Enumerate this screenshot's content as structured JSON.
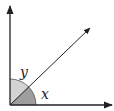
{
  "diagram": {
    "type": "angle-diagram",
    "labels": {
      "x": "x",
      "y": "y"
    },
    "colors": {
      "line": "#222222",
      "sector_y": "#d4d4d4",
      "sector_x": "#9e9e9e",
      "background": "#ffffff"
    },
    "elements": [
      {
        "kind": "axis",
        "direction": "vertical",
        "arrow": true
      },
      {
        "kind": "axis",
        "direction": "horizontal",
        "arrow": true
      },
      {
        "kind": "ray",
        "direction": "diagonal",
        "arrow": true
      },
      {
        "kind": "angle-sector",
        "label": "y",
        "shade": "light"
      },
      {
        "kind": "angle-sector",
        "label": "x",
        "shade": "dark"
      }
    ]
  }
}
